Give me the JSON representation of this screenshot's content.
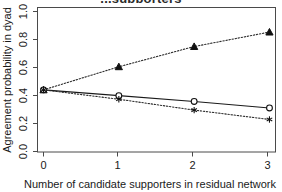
{
  "chart_data": {
    "type": "line",
    "title": "...supporters",
    "title_note": "title row is cropped off the top edge of the screenshot; only descenders are visible",
    "xlabel": "Number of candidate supporters in residual network",
    "ylabel": "Agreement probability in dyad",
    "x": [
      0,
      1,
      2,
      3
    ],
    "xticklabels": [
      "0",
      "1",
      "2",
      "3"
    ],
    "yticklabels": [
      "0.0",
      "0.2",
      "0.4",
      "0.6",
      "0.8",
      "1.0"
    ],
    "yticks": [
      0.0,
      0.2,
      0.4,
      0.6,
      0.8,
      1.0
    ],
    "xlim": [
      -0.08,
      3.08
    ],
    "ylim": [
      0.0,
      1.0
    ],
    "grid": false,
    "legend": "none",
    "series": [
      {
        "name": "rising-triangle",
        "marker": "filled-triangle",
        "linestyle": "dotted",
        "values": [
          0.43,
          0.59,
          0.73,
          0.83
        ]
      },
      {
        "name": "declining-circle",
        "marker": "open-circle",
        "linestyle": "solid",
        "values": [
          0.43,
          0.39,
          0.35,
          0.305
        ]
      },
      {
        "name": "declining-asterisk",
        "marker": "asterisk",
        "linestyle": "dotted",
        "values": [
          0.43,
          0.365,
          0.29,
          0.225
        ]
      }
    ]
  },
  "colors": {
    "background": "#ffffff",
    "ink": "#1a1a1a",
    "axis": "#4a4a4a"
  }
}
